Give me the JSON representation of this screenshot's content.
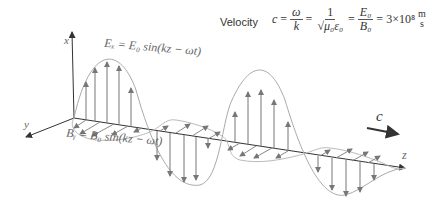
{
  "velocity": {
    "label": "Velocity",
    "c": "c",
    "omega": "ω",
    "k": "k",
    "one": "1",
    "sqrt_mu_eps": "√μ₀ε₀",
    "E0": "E₀",
    "B0": "B₀",
    "value": "3×10⁸",
    "unit_num": "m",
    "unit_den": "s"
  },
  "axes": {
    "x": "x",
    "y": "y",
    "z": "z"
  },
  "equations": {
    "electric": "Eₓ = E₀ sin(kz − ωt)",
    "magnetic": "Bᵧ = B₀ sin(kz − ωt)"
  },
  "propagation": {
    "label": "c"
  },
  "colors": {
    "wave": "#aaaaaa",
    "arrow": "#777777",
    "axis": "#333333",
    "text": "#555555"
  }
}
